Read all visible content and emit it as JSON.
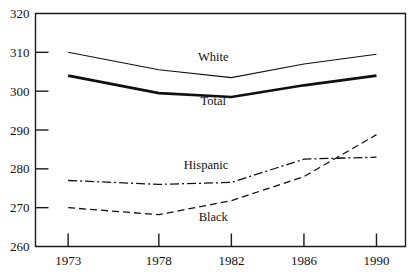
{
  "chart_data": {
    "type": "line",
    "title": "",
    "subtitle": "",
    "xlabel": "",
    "ylabel": "",
    "x": [
      1973,
      1978,
      1982,
      1986,
      1990
    ],
    "categories": [
      "1973",
      "1978",
      "1982",
      "1986",
      "1990"
    ],
    "xtick_labels": [
      "1973",
      "1978",
      "1982",
      "1986",
      "1990"
    ],
    "ytick_labels": [
      "260",
      "270",
      "280",
      "290",
      "300",
      "310",
      "320"
    ],
    "ytick_values": [
      260,
      270,
      280,
      290,
      300,
      310,
      320
    ],
    "ylim": [
      260,
      320
    ],
    "xlim": [
      1971.2,
      1991.6
    ],
    "grid": false,
    "legend_position": "inline-annotations",
    "series": [
      {
        "name": "White",
        "label": "White",
        "style": "solid-thin",
        "values": [
          310.0,
          305.5,
          303.5,
          307.0,
          309.5
        ],
        "label_x": 1981.0,
        "label_y": 307.8
      },
      {
        "name": "Total",
        "label": "Total",
        "style": "solid-thick",
        "values": [
          304.0,
          299.5,
          298.5,
          301.5,
          304.0
        ],
        "label_x": 1981.0,
        "label_y": 296.5
      },
      {
        "name": "Hispanic",
        "label": "Hispanic",
        "style": "dash-dot",
        "values": [
          277.0,
          276.0,
          276.5,
          282.5,
          283.0
        ],
        "label_x": 1980.6,
        "label_y": 280.0
      },
      {
        "name": "Black",
        "label": "Black",
        "style": "dashed",
        "values": [
          270.0,
          268.2,
          271.8,
          278.0,
          288.8
        ],
        "label_x": 1981.0,
        "label_y": 266.6
      }
    ],
    "annotations": [
      "White",
      "Total",
      "Hispanic",
      "Black"
    ],
    "colors": {
      "line": "#101010",
      "axis": "#1a1a1a",
      "background": "#ffffff"
    }
  }
}
